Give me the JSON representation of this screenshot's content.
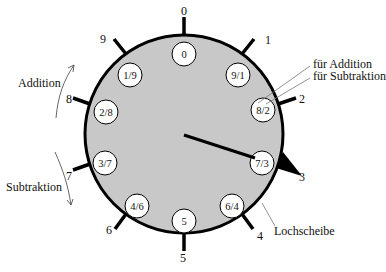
{
  "diagram": {
    "dial": {
      "cx": 184,
      "cy": 134,
      "r": 99,
      "fill": "#c8c8c8",
      "stroke": "#000000"
    },
    "outer_numbers": [
      {
        "label": "0",
        "angle": 0
      },
      {
        "label": "1",
        "angle": 36
      },
      {
        "label": "2",
        "angle": 72
      },
      {
        "label": "3",
        "angle": 108
      },
      {
        "label": "4",
        "angle": 144
      },
      {
        "label": "5",
        "angle": 180
      },
      {
        "label": "6",
        "angle": 216
      },
      {
        "label": "7",
        "angle": 252
      },
      {
        "label": "8",
        "angle": 288
      },
      {
        "label": "9",
        "angle": 324
      }
    ],
    "holes": [
      {
        "label": "0",
        "x": 184,
        "y": 54
      },
      {
        "label": "9/1",
        "x": 238,
        "y": 75
      },
      {
        "label": "8/2",
        "x": 263,
        "y": 110
      },
      {
        "label": "7/3",
        "x": 262,
        "y": 163
      },
      {
        "label": "6/4",
        "x": 232,
        "y": 206
      },
      {
        "label": "5",
        "x": 184,
        "y": 221
      },
      {
        "label": "4/6",
        "x": 137,
        "y": 206
      },
      {
        "label": "3/7",
        "x": 105,
        "y": 163
      },
      {
        "label": "2/8",
        "x": 106,
        "y": 112
      },
      {
        "label": "1/9",
        "x": 130,
        "y": 75
      }
    ],
    "annotations": {
      "addition": "Addition",
      "subtraktion": "Subtraktion",
      "fuer_addition": "für Addition",
      "fuer_subtraktion": "für Subtraktion",
      "lochscheibe": "Lochscheibe"
    }
  }
}
